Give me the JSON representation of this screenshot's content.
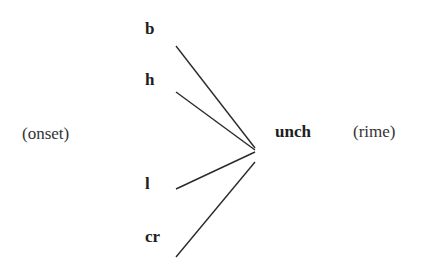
{
  "diagram": {
    "title": "",
    "onset_label": "(onset)",
    "rime_label": "(rime)",
    "onsets": [
      {
        "text": "b"
      },
      {
        "text": "h"
      },
      {
        "text": "l"
      },
      {
        "text": "cr"
      }
    ],
    "rime": {
      "text": "unch"
    },
    "edges": [
      {
        "from": "b",
        "to": "unch"
      },
      {
        "from": "h",
        "to": "unch"
      },
      {
        "from": "l",
        "to": "unch"
      },
      {
        "from": "cr",
        "to": "unch"
      }
    ],
    "colors": {
      "text": "#1e1e1e",
      "line": "#2a2a2a",
      "background": "#ffffff"
    }
  }
}
